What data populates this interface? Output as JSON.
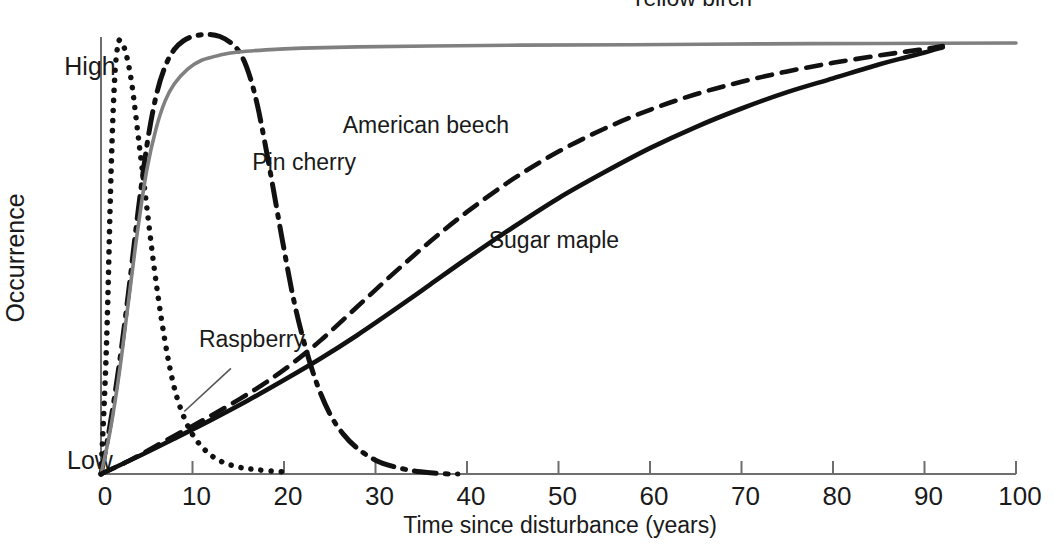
{
  "chart_data": {
    "type": "line",
    "title": "",
    "xlabel": "Time since disturbance (years)",
    "ylabel": "Occurrence",
    "xlim": [
      0,
      100
    ],
    "ylim": [
      0,
      1
    ],
    "grid": false,
    "legend_position": "inline-annotations",
    "xticks": [
      0,
      10,
      20,
      30,
      40,
      50,
      60,
      70,
      80,
      90,
      100
    ],
    "xticklabels": [
      "0",
      "10",
      "20",
      "30",
      "40",
      "50",
      "60",
      "70",
      "80",
      "90",
      "100"
    ],
    "yticklabels": [
      "Low",
      "High"
    ],
    "yticks": [
      0,
      1
    ],
    "series": [
      {
        "name": "Raspberry",
        "style": "dotted",
        "color": "#111111",
        "label": "Raspberry",
        "label_x": 16.5,
        "label_y": 0.295,
        "leader_from": [
          14.2,
          0.245
        ],
        "leader_to": [
          9.1,
          0.145
        ],
        "x": [
          0,
          0.6,
          1.1,
          1.5,
          1.9,
          2.3,
          2.8,
          3.4,
          4.2,
          5.0,
          5.8,
          6.6,
          7.4,
          8.2,
          9.2,
          10.2,
          11.4,
          12.6,
          14.0,
          15.5,
          17.0,
          19.0,
          20.0
        ],
        "y": [
          0.0,
          0.3,
          0.7,
          0.92,
          1.0,
          1.0,
          0.97,
          0.9,
          0.76,
          0.62,
          0.48,
          0.36,
          0.26,
          0.185,
          0.125,
          0.085,
          0.055,
          0.035,
          0.022,
          0.014,
          0.01,
          0.006,
          0.005
        ]
      },
      {
        "name": "Pin cherry",
        "style": "dash-dot",
        "color": "#111111",
        "label": "Pin cherry",
        "label_x": 22.2,
        "label_y": 0.705,
        "x": [
          0,
          1.0,
          2.0,
          3.0,
          4.0,
          5.0,
          6.0,
          7.0,
          8.0,
          9.0,
          10.0,
          11.5,
          13.0,
          14.5,
          15.5,
          16.3,
          17.1,
          17.9,
          18.8,
          19.8,
          21.0,
          22.2,
          23.5,
          25.0,
          26.5,
          28.0,
          30.0,
          32.0,
          34.0,
          36.0,
          38.0,
          39.0
        ],
        "y": [
          0.0,
          0.115,
          0.255,
          0.42,
          0.6,
          0.76,
          0.875,
          0.945,
          0.985,
          1.005,
          1.015,
          1.02,
          1.015,
          0.995,
          0.965,
          0.92,
          0.855,
          0.77,
          0.665,
          0.545,
          0.41,
          0.305,
          0.215,
          0.14,
          0.092,
          0.06,
          0.032,
          0.017,
          0.008,
          0.003,
          0.0,
          0.0
        ]
      },
      {
        "name": "Yellow birch",
        "style": "solid-gray",
        "color": "#808080",
        "label": "Yellow birch",
        "label_x": 64.5,
        "label_y": 1.085,
        "x": [
          0,
          1.0,
          2.0,
          3.0,
          4.0,
          5.0,
          6.0,
          7.0,
          8.0,
          9.5,
          11.0,
          13.0,
          15.0,
          18.0,
          22.0,
          28.0,
          36.0,
          46.0,
          58.0,
          72.0,
          85.0,
          100.0
        ],
        "y": [
          0.0,
          0.1,
          0.235,
          0.4,
          0.565,
          0.705,
          0.8,
          0.865,
          0.905,
          0.94,
          0.96,
          0.972,
          0.979,
          0.984,
          0.988,
          0.991,
          0.993,
          0.995,
          0.996,
          0.998,
          0.999,
          1.0
        ]
      },
      {
        "name": "American beech",
        "style": "dashed",
        "color": "#111111",
        "label": "American beech",
        "label_x": 35.5,
        "label_y": 0.792,
        "x": [
          0,
          3,
          6,
          9,
          12,
          15,
          18,
          21,
          24,
          28,
          32,
          36,
          40,
          45,
          50,
          55,
          60,
          65,
          70,
          75,
          80,
          85,
          88,
          90,
          92
        ],
        "y": [
          0.0,
          0.03,
          0.065,
          0.1,
          0.135,
          0.172,
          0.212,
          0.258,
          0.31,
          0.388,
          0.466,
          0.54,
          0.608,
          0.684,
          0.748,
          0.801,
          0.845,
          0.881,
          0.91,
          0.934,
          0.954,
          0.971,
          0.98,
          0.986,
          0.993
        ]
      },
      {
        "name": "Sugar maple",
        "style": "solid-black",
        "color": "#111111",
        "label": "Sugar maple",
        "label_x": 49.5,
        "label_y": 0.525,
        "x": [
          0,
          4,
          8,
          12,
          16,
          20,
          24,
          28,
          32,
          36,
          40,
          45,
          50,
          55,
          60,
          65,
          70,
          75,
          80,
          85,
          88,
          90,
          92
        ],
        "y": [
          0.0,
          0.04,
          0.082,
          0.125,
          0.17,
          0.218,
          0.268,
          0.322,
          0.38,
          0.44,
          0.5,
          0.572,
          0.64,
          0.7,
          0.756,
          0.805,
          0.848,
          0.886,
          0.918,
          0.95,
          0.967,
          0.978,
          0.99
        ]
      }
    ]
  },
  "colors": {
    "axis": "#6e6e6e",
    "ink": "#1a1a1a",
    "gray_series": "#808080"
  }
}
